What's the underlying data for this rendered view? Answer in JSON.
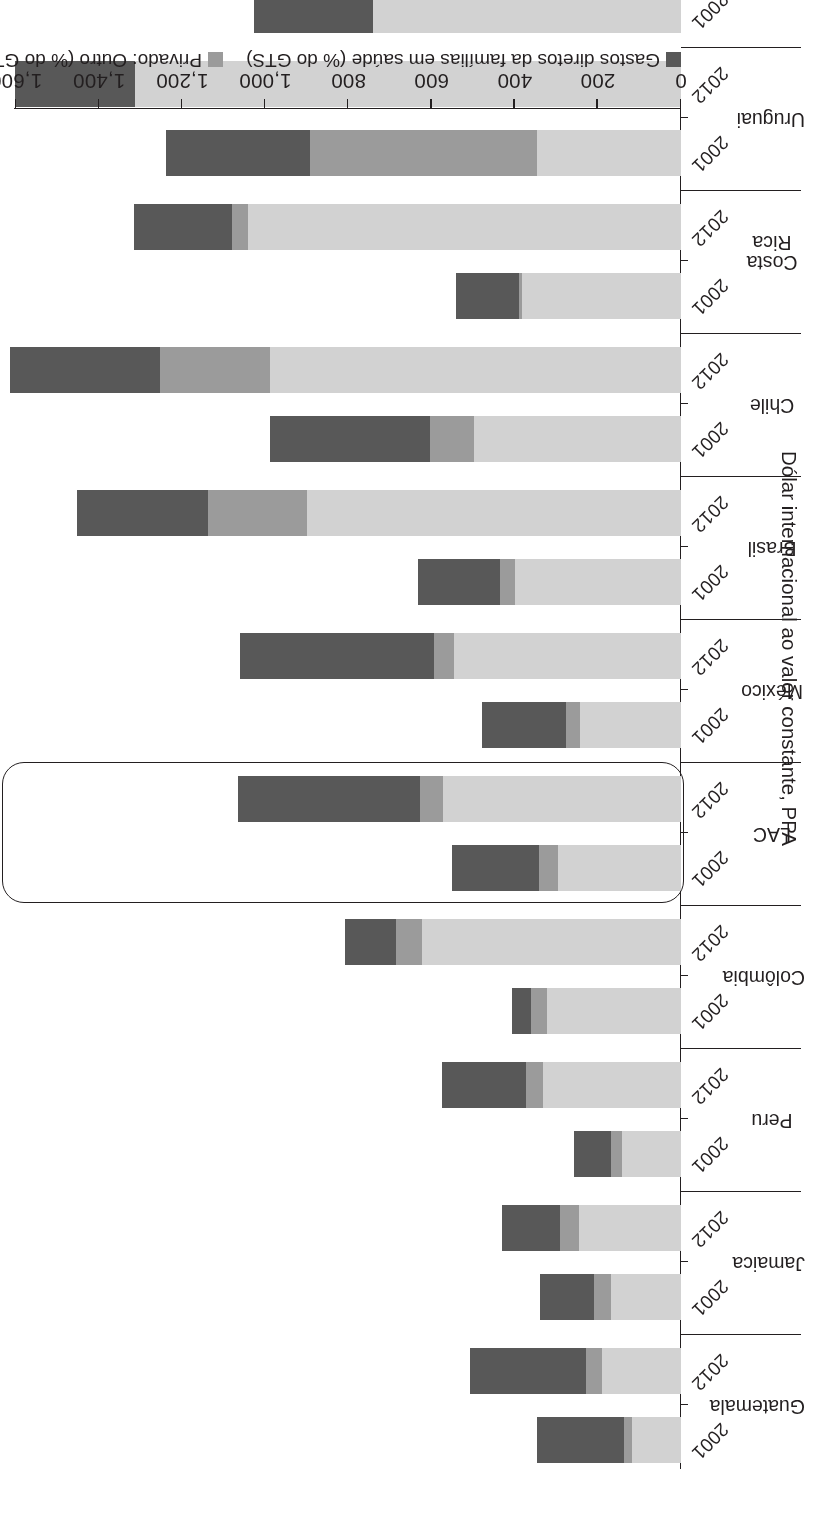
{
  "chart_data": {
    "type": "bar",
    "orientation": "horizontal-stacked",
    "title": "",
    "xlabel": "",
    "ylabel": "Dólar internacional ao valor constante, PPA",
    "value_axis_title": "Dólar internacional ao valor constante, PPA",
    "value_axis_ticks": [
      "0",
      "200",
      "400",
      "600",
      "800",
      "1,000",
      "1,200",
      "1,400",
      "1,600"
    ],
    "value_axis_tick_values": [
      0,
      200,
      400,
      600,
      800,
      1000,
      1200,
      1400,
      1600
    ],
    "ylim": [
      0,
      1600
    ],
    "grid": false,
    "legend_position": "bottom-left",
    "highlighted_group": "LAC",
    "series": [
      {
        "name": "Público (% do GTS)",
        "color": "#d2d2d2",
        "key": "publico"
      },
      {
        "name": "Privado: Outro (% do GTS)",
        "color": "#9b9b9b",
        "key": "privado_outro"
      },
      {
        "name": "Gastos diretos da famílias em saúde (% do GTS)",
        "color": "#585858",
        "key": "gastos_diretos"
      }
    ],
    "categories": [
      "Guatemala",
      "Jamaica",
      "Peru",
      "Colômbia",
      "LAC",
      "México",
      "Brasil",
      "Chile",
      "Costa Rica",
      "Uruguai",
      "Argentina"
    ],
    "years": [
      "2001",
      "2012"
    ],
    "groups": [
      {
        "country": "Guatemala",
        "bars": [
          {
            "year": "2001",
            "publico": 118,
            "privado_outro": 18,
            "gastos_diretos": 211,
            "total": 347
          },
          {
            "year": "2012",
            "publico": 190,
            "privado_outro": 39,
            "gastos_diretos": 279,
            "total": 508
          }
        ]
      },
      {
        "country": "Jamaica",
        "bars": [
          {
            "year": "2001",
            "publico": 169,
            "privado_outro": 41,
            "gastos_diretos": 129,
            "total": 339
          },
          {
            "year": "2012",
            "publico": 246,
            "privado_outro": 46,
            "gastos_diretos": 139,
            "total": 431
          }
        ]
      },
      {
        "country": "Peru",
        "bars": [
          {
            "year": "2001",
            "publico": 143,
            "privado_outro": 26,
            "gastos_diretos": 88,
            "total": 257
          },
          {
            "year": "2012",
            "publico": 331,
            "privado_outro": 42,
            "gastos_diretos": 202,
            "total": 575
          }
        ]
      },
      {
        "country": "Colômbia",
        "bars": [
          {
            "year": "2001",
            "publico": 322,
            "privado_outro": 38,
            "gastos_diretos": 47,
            "total": 407
          },
          {
            "year": "2012",
            "publico": 623,
            "privado_outro": 62,
            "gastos_diretos": 123,
            "total": 808
          }
        ]
      },
      {
        "country": "LAC",
        "bars": [
          {
            "year": "2001",
            "publico": 297,
            "privado_outro": 44,
            "gastos_diretos": 210,
            "total": 551
          },
          {
            "year": "2012",
            "publico": 572,
            "privado_outro": 55,
            "gastos_diretos": 439,
            "total": 1066
          }
        ]
      },
      {
        "country": "México",
        "bars": [
          {
            "year": "2001",
            "publico": 244,
            "privado_outro": 33,
            "gastos_diretos": 201,
            "total": 478
          },
          {
            "year": "2012",
            "publico": 545,
            "privado_outro": 49,
            "gastos_diretos": 467,
            "total": 1061
          }
        ]
      },
      {
        "country": "Brasil",
        "bars": [
          {
            "year": "2001",
            "publico": 399,
            "privado_outro": 36,
            "gastos_diretos": 199,
            "total": 634
          },
          {
            "year": "2012",
            "publico": 900,
            "privado_outro": 238,
            "gastos_diretos": 316,
            "total": 1454
          }
        ]
      },
      {
        "country": "Chile",
        "bars": [
          {
            "year": "2001",
            "publico": 499,
            "privado_outro": 105,
            "gastos_diretos": 385,
            "total": 989
          },
          {
            "year": "2012",
            "publico": 989,
            "privado_outro": 265,
            "gastos_diretos": 360,
            "total": 1614
          }
        ]
      },
      {
        "country": "Costa Rica",
        "bars": [
          {
            "year": "2001",
            "publico": 382,
            "privado_outro": 8,
            "gastos_diretos": 151,
            "total": 541
          },
          {
            "year": "2012",
            "publico": 1043,
            "privado_outro": 37,
            "gastos_diretos": 235,
            "total": 1315
          }
        ]
      },
      {
        "country": "Uruguai",
        "bars": [
          {
            "year": "2001",
            "publico": 346,
            "privado_outro": 547,
            "gastos_diretos": 346,
            "total": 1239
          },
          {
            "year": "2012",
            "publico": 1314,
            "privado_outro": 0,
            "gastos_diretos": 288,
            "total": 1602
          }
        ]
      },
      {
        "country": "Argentina",
        "bars": [
          {
            "year": "2001",
            "publico": 741,
            "privado_outro": 0,
            "gastos_diretos": 287,
            "total": 1028
          },
          {
            "year": "2012",
            "publico": 1206,
            "privado_outro": 0,
            "gastos_diretos": 358,
            "total": 1564
          }
        ]
      }
    ]
  },
  "legend": {
    "items": [
      {
        "label": "Gastos diretos da famílias em saúde (% do GTS)",
        "color": "#585858"
      },
      {
        "label": "Privado: Outro (% do GTS)",
        "color": "#9b9b9b"
      },
      {
        "label": "Público (% do GTS)",
        "color": "#d2d2d2"
      }
    ]
  },
  "axis": {
    "value_title": "Dólar internacional ao valor constante, PPA",
    "ticks": [
      "0",
      "200",
      "400",
      "600",
      "800",
      "1,000",
      "1,200",
      "1,400",
      "1,600"
    ]
  },
  "colors": {
    "gastos_diretos": "#585858",
    "privado_outro": "#9b9b9b",
    "publico": "#d2d2d2",
    "axis": "#231f20",
    "background": "#ffffff"
  }
}
